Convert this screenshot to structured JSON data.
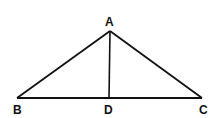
{
  "diagram": {
    "type": "triangle-with-altitude",
    "stroke_color": "#111111",
    "background": "#ffffff",
    "points": {
      "A": {
        "label": "A",
        "x": 110,
        "y": 31
      },
      "B": {
        "label": "B",
        "x": 17,
        "y": 98
      },
      "C": {
        "label": "C",
        "x": 202,
        "y": 98
      },
      "D": {
        "label": "D",
        "x": 109,
        "y": 98
      }
    },
    "segments": [
      "AB",
      "AC",
      "BC",
      "AD"
    ]
  }
}
